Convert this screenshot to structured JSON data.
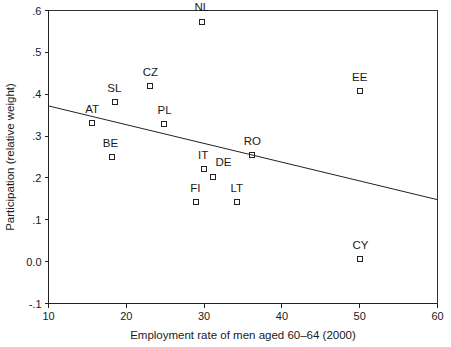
{
  "chart_data": {
    "type": "scatter",
    "title": "",
    "xlabel": "Employment rate of men aged 60–64 (2000)",
    "ylabel": "Participation (relative weight)",
    "xlim": [
      10,
      60
    ],
    "ylim": [
      -0.1,
      0.6
    ],
    "xticks": [
      10,
      20,
      30,
      40,
      50,
      60
    ],
    "xtick_labels": [
      "10",
      "20",
      "30",
      "40",
      "50",
      "60"
    ],
    "yticks": [
      0.6,
      0.5,
      0.4,
      0.3,
      0.2,
      0.1,
      0.0,
      -0.1
    ],
    "ytick_labels": [
      ".6",
      ".5",
      ".4",
      ".3",
      ".2",
      ".1",
      "0.0",
      "-.1"
    ],
    "grid": false,
    "legend": "none",
    "marker": "open-square",
    "points": [
      {
        "label": "NL",
        "x": 29.7,
        "y": 0.572,
        "label_dx": 0,
        "label_dy": -11
      },
      {
        "label": "CZ",
        "x": 23.1,
        "y": 0.419,
        "label_dx": 0,
        "label_dy": -10
      },
      {
        "label": "EE",
        "x": 50.0,
        "y": 0.408,
        "label_dx": 0,
        "label_dy": -10
      },
      {
        "label": "SL",
        "x": 18.6,
        "y": 0.381,
        "label_dx": -1,
        "label_dy": -10
      },
      {
        "label": "AT",
        "x": 15.6,
        "y": 0.332,
        "label_dx": 0,
        "label_dy": -10
      },
      {
        "label": "PL",
        "x": 24.8,
        "y": 0.33,
        "label_dx": 1,
        "label_dy": -10
      },
      {
        "label": "RO",
        "x": 36.2,
        "y": 0.254,
        "label_dx": 0,
        "label_dy": -10
      },
      {
        "label": "BE",
        "x": 18.1,
        "y": 0.251,
        "label_dx": -1,
        "label_dy": -10
      },
      {
        "label": "IT",
        "x": 30.0,
        "y": 0.222,
        "label_dx": -1,
        "label_dy": -10
      },
      {
        "label": "DE",
        "x": 31.2,
        "y": 0.203,
        "label_dx": 10,
        "label_dy": -11
      },
      {
        "label": "FI",
        "x": 29.0,
        "y": 0.142,
        "label_dx": -1,
        "label_dy": -10
      },
      {
        "label": "LT",
        "x": 34.2,
        "y": 0.142,
        "label_dx": 0,
        "label_dy": -10
      },
      {
        "label": "CY",
        "x": 50.1,
        "y": 0.007,
        "label_dx": 0,
        "label_dy": -10
      }
    ],
    "trendline": {
      "x_start": 10,
      "y_start": 0.372,
      "x_end": 60,
      "y_end": 0.148,
      "description": "fitted regression line (negative slope)"
    },
    "colors": {
      "axis": "#222222",
      "marker": "#222222",
      "trendline": "#222222",
      "text": "#1a1a1a",
      "background": "#ffffff"
    }
  }
}
